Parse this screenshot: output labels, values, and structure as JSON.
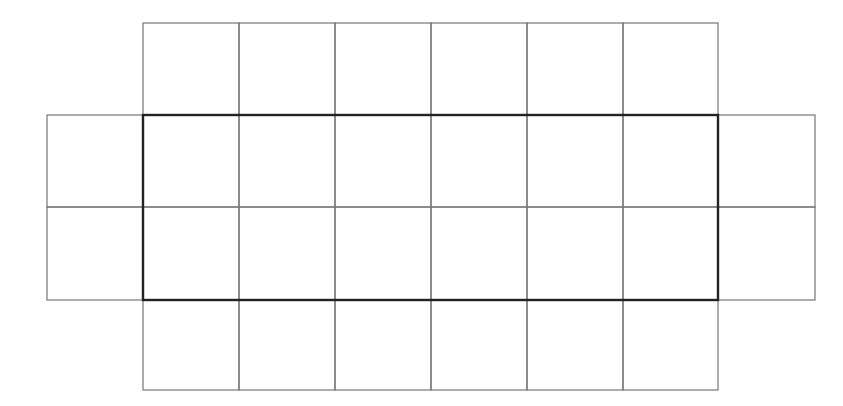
{
  "diagram": {
    "colors": {
      "grid_line": "#777777",
      "outline": "#222222",
      "background": "#ffffff"
    },
    "columns_x": [
      143,
      239,
      335,
      431,
      527,
      623,
      718
    ],
    "rows_y": [
      23,
      115,
      207,
      300,
      390
    ],
    "left_flap_x": [
      47,
      143
    ],
    "right_flap_x": [
      718,
      815
    ],
    "central_rectangle": {
      "x": 143,
      "y": 115,
      "width": 575,
      "height": 185
    }
  }
}
